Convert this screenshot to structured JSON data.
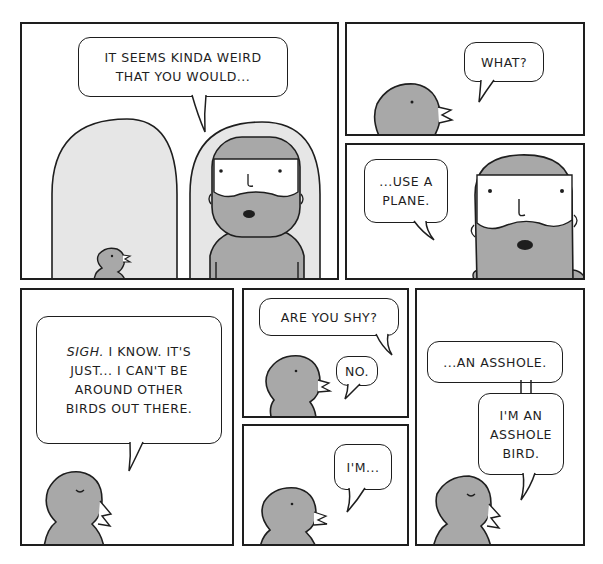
{
  "comic": {
    "colors": {
      "ink": "#1e1e1e",
      "character_gray": "#a8a8a8",
      "background_gray": "#e6e6e6",
      "paper": "#ffffff"
    },
    "panels": [
      {
        "id": 1,
        "scene": "man and bird standing in front of two tall rounded airplane-seat shapes",
        "dialogue": [
          {
            "speaker": "man",
            "text": "IT SEEMS KINDA WEIRD\nTHAT YOU WOULD..."
          }
        ]
      },
      {
        "id": 2,
        "scene": "close-up of bird",
        "dialogue": [
          {
            "speaker": "bird",
            "text": "WHAT?"
          }
        ]
      },
      {
        "id": 3,
        "scene": "close-up of bearded man",
        "dialogue": [
          {
            "speaker": "man",
            "text": "...USE A\nPLANE."
          }
        ]
      },
      {
        "id": 4,
        "scene": "bird with eyes closed",
        "dialogue": [
          {
            "speaker": "bird",
            "emphasis": "SIGH.",
            "text": " I KNOW. IT'S\nJUST... I CAN'T  BE\nAROUND OTHER\nBIRDS OUT THERE."
          }
        ]
      },
      {
        "id": 5,
        "scene": "bird",
        "dialogue": [
          {
            "speaker": "man",
            "text": "ARE YOU SHY?"
          },
          {
            "speaker": "bird",
            "text": "NO."
          }
        ]
      },
      {
        "id": 6,
        "scene": "bird",
        "dialogue": [
          {
            "speaker": "bird",
            "text": "I'M..."
          }
        ]
      },
      {
        "id": 7,
        "scene": "bird with eyes closed",
        "dialogue": [
          {
            "speaker": "bird",
            "text": "...AN ASSHOLE."
          },
          {
            "speaker": "bird",
            "text": "I'M AN\nASSHOLE\nBIRD."
          }
        ]
      }
    ]
  }
}
